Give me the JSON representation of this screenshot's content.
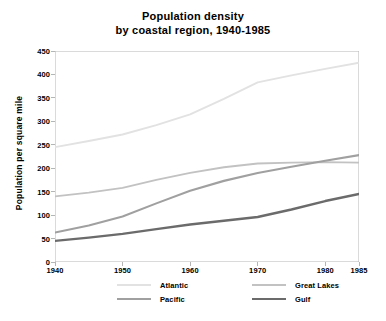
{
  "chart_data": {
    "type": "line",
    "title": "Population density by coastal region, 1940-1985",
    "title_line1": "Population density",
    "title_line2": "by coastal region, 1940-1985",
    "xlabel": "",
    "ylabel": "Population per square mile",
    "x": [
      1940,
      1945,
      1950,
      1955,
      1960,
      1965,
      1970,
      1975,
      1980,
      1985
    ],
    "xlim": [
      1940,
      1985
    ],
    "ylim": [
      0,
      450
    ],
    "xticks": [
      "1940",
      "1950",
      "1960",
      "1970",
      "1980",
      "1985"
    ],
    "xtick_values": [
      1940,
      1950,
      1960,
      1970,
      1980,
      1985
    ],
    "yticks": [
      "0",
      "50",
      "100",
      "150",
      "200",
      "250",
      "300",
      "350",
      "400",
      "450"
    ],
    "ytick_values": [
      0,
      50,
      100,
      150,
      200,
      250,
      300,
      350,
      400,
      450
    ],
    "grid": false,
    "legend_position": "bottom",
    "series": [
      {
        "name": "Atlantic",
        "color": "#e2e2e2",
        "values": [
          245,
          258,
          272,
          292,
          315,
          348,
          383,
          398,
          412,
          425
        ]
      },
      {
        "name": "Great Lakes",
        "color": "#c2c2c2",
        "values": [
          140,
          148,
          158,
          175,
          190,
          202,
          210,
          212,
          213,
          212
        ]
      },
      {
        "name": "Pacific",
        "color": "#a0a0a0",
        "values": [
          63,
          78,
          97,
          125,
          152,
          173,
          190,
          203,
          216,
          228
        ]
      },
      {
        "name": "Gulf",
        "color": "#6b6b6b",
        "values": [
          45,
          52,
          60,
          70,
          80,
          88,
          96,
          112,
          130,
          145
        ]
      }
    ]
  },
  "axis": {
    "line_color": "#b5b5b5",
    "tick_color": "#b5b5b5"
  }
}
